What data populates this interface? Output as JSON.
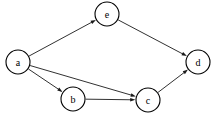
{
  "figure": {
    "name": "directed-graph",
    "type": "directed-acyclic-graph",
    "background_color": "#ffffff",
    "stroke_color": "#1a1a1a",
    "node_fill_color": "#ffffff",
    "node_stroke_color": "#000000",
    "label_color": "#000000",
    "width": 216,
    "height": 124
  },
  "nodes": [
    {
      "id": "a",
      "label": "a",
      "cx": 18,
      "cy": 62,
      "r": 12
    },
    {
      "id": "b",
      "label": "b",
      "cx": 73,
      "cy": 99,
      "r": 12
    },
    {
      "id": "c",
      "label": "c",
      "cx": 148,
      "cy": 100,
      "r": 12
    },
    {
      "id": "d",
      "label": "d",
      "cx": 198,
      "cy": 62,
      "r": 12
    },
    {
      "id": "e",
      "label": "e",
      "cx": 107,
      "cy": 14,
      "r": 12
    }
  ],
  "edges": [
    {
      "id": "a-e",
      "from": "a",
      "to": "e",
      "directed": true,
      "label": ""
    },
    {
      "id": "a-c",
      "from": "a",
      "to": "c",
      "directed": true,
      "label": ""
    },
    {
      "id": "a-b",
      "from": "a",
      "to": "b",
      "directed": true,
      "label": ""
    },
    {
      "id": "b-c",
      "from": "b",
      "to": "c",
      "directed": true,
      "label": ""
    },
    {
      "id": "e-d",
      "from": "e",
      "to": "d",
      "directed": true,
      "label": ""
    },
    {
      "id": "c-d",
      "from": "c",
      "to": "d",
      "directed": true,
      "label": ""
    }
  ],
  "labels": {
    "a": "a",
    "b": "b",
    "c": "c",
    "d": "d",
    "e": "e"
  }
}
